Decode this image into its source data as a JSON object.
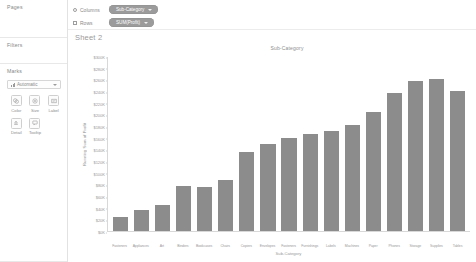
{
  "app": {
    "sheet_name": "Sheet 2"
  },
  "cards": {
    "pages": {
      "title": "Pages"
    },
    "filters": {
      "title": "Filters"
    },
    "marks": {
      "title": "Marks",
      "mark_type": "Automatic",
      "mark_type_icon": "bar-mark-icon",
      "buttons": [
        {
          "label": "Color",
          "icon": "color-icon"
        },
        {
          "label": "Size",
          "icon": "size-icon"
        },
        {
          "label": "Label",
          "icon": "label-icon"
        },
        {
          "label": "Detail",
          "icon": "detail-icon"
        },
        {
          "label": "Tooltip",
          "icon": "tooltip-icon"
        }
      ]
    }
  },
  "shelves": [
    {
      "label": "Columns",
      "icon": "columns-icon",
      "pill": "Sub-Category"
    },
    {
      "label": "Rows",
      "icon": "rows-icon",
      "pill": "SUM(Profit)"
    }
  ],
  "chart_data": {
    "type": "bar",
    "title": "Sub-Category",
    "xlabel": "Sub-Category",
    "ylabel": "Running Sum of Profit",
    "ylim": [
      0,
      300000
    ],
    "ytick_labels": [
      "$0K",
      "$20K",
      "$40K",
      "$60K",
      "$80K",
      "$100K",
      "$120K",
      "$140K",
      "$160K",
      "$180K",
      "$200K",
      "$220K",
      "$240K",
      "$260K",
      "$280K",
      "$300K"
    ],
    "ytick_values": [
      0,
      20000,
      40000,
      60000,
      80000,
      100000,
      120000,
      140000,
      160000,
      180000,
      200000,
      220000,
      240000,
      260000,
      280000,
      300000
    ],
    "grid": false,
    "legend": "none",
    "categories": [
      "Fasteners",
      "Appliances",
      "Art",
      "Binders",
      "Bookcases",
      "Chairs",
      "Copiers",
      "Envelopes",
      "Fasteners",
      "Furnishings",
      "Labels",
      "Machines",
      "Paper",
      "Phones",
      "Storage",
      "Supplies",
      "Tables"
    ],
    "values": [
      24000,
      36000,
      44000,
      78000,
      76000,
      88000,
      136000,
      150000,
      160000,
      168000,
      172000,
      182000,
      206000,
      238000,
      258000,
      262000,
      242000
    ]
  }
}
